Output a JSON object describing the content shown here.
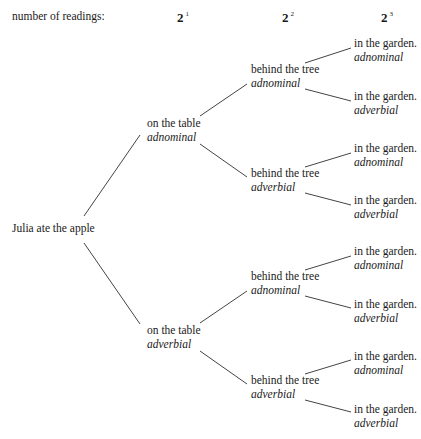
{
  "header": {
    "label": "number of readings:",
    "levels": [
      {
        "base": "2",
        "exp": "1"
      },
      {
        "base": "2",
        "exp": "2"
      },
      {
        "base": "2",
        "exp": "3"
      }
    ]
  },
  "tree": {
    "root": "Julia ate the apple",
    "level1": [
      {
        "phrase": "on the table",
        "reading": "adnominal"
      },
      {
        "phrase": "on the table",
        "reading": "adverbial"
      }
    ],
    "level2": [
      {
        "phrase": "behind the tree",
        "reading": "adnominal"
      },
      {
        "phrase": "behind the tree",
        "reading": "adverbial"
      },
      {
        "phrase": "behind the tree",
        "reading": "adnominal"
      },
      {
        "phrase": "behind the tree",
        "reading": "adverbial"
      }
    ],
    "level3": [
      {
        "phrase": "in the garden.",
        "reading": "adnominal"
      },
      {
        "phrase": "in the garden.",
        "reading": "adverbial"
      },
      {
        "phrase": "in the garden.",
        "reading": "adnominal"
      },
      {
        "phrase": "in the garden.",
        "reading": "adverbial"
      },
      {
        "phrase": "in the garden.",
        "reading": "adnominal"
      },
      {
        "phrase": "in the garden.",
        "reading": "adverbial"
      },
      {
        "phrase": "in the garden.",
        "reading": "adnominal"
      },
      {
        "phrase": "in the garden.",
        "reading": "adverbial"
      }
    ]
  }
}
